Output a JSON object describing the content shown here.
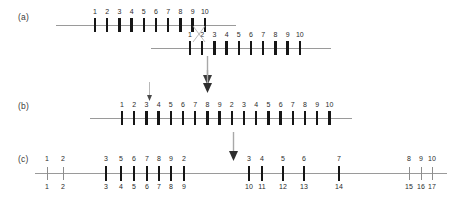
{
  "figure": {
    "panels": [
      {
        "id": "a",
        "label": "(a)",
        "label_x": 18,
        "label_y": 12,
        "description": "Two homologous chromosomes aligned with a crossover point",
        "chromosomes": [
          {
            "name": "chromosome-upper",
            "line_x": 56,
            "line_y": 25,
            "line_width": 180,
            "tick_start": 95,
            "tick_spacing": 12.2,
            "tick_top": 18,
            "tick_height": 14,
            "label_y": 8,
            "labels": [
              "1",
              "2",
              "3",
              "4",
              "5",
              "6",
              "7",
              "8",
              "9",
              "10"
            ]
          },
          {
            "name": "chromosome-lower",
            "line_x": 151,
            "line_y": 48,
            "line_width": 180,
            "tick_start": 190,
            "tick_spacing": 12.2,
            "tick_top": 41,
            "tick_height": 14,
            "label_y": 31,
            "labels": [
              "1",
              "2",
              "3",
              "4",
              "5",
              "6",
              "7",
              "8",
              "9",
              "10"
            ]
          }
        ],
        "crossover": {
          "name": "crossover-x",
          "x": 192,
          "y": 26,
          "width": 14,
          "height": 16
        }
      },
      {
        "id": "b",
        "label": "(b)",
        "label_x": 18,
        "label_y": 101,
        "description": "Recombinant chromosome after crossover",
        "chromosomes": [
          {
            "name": "chromosome-recombinant",
            "line_x": 90,
            "line_y": 118,
            "line_width": 262,
            "tick_start": 122,
            "tick_spacing": 12.2,
            "tick_top": 111,
            "tick_height": 14,
            "label_y": 101,
            "labels": [
              "1",
              "2",
              "3",
              "4",
              "5",
              "6",
              "7",
              "8",
              "9",
              "2",
              "3",
              "4",
              "5",
              "6",
              "7",
              "8",
              "9",
              "10"
            ]
          }
        ]
      },
      {
        "id": "c",
        "label": "(c)",
        "label_x": 18,
        "label_y": 154,
        "description": "Marker map with upper and lower coordinate numbering",
        "axis": {
          "name": "axis-map",
          "line_x": 35,
          "line_y": 173,
          "line_width": 412
        },
        "markers": [
          {
            "x": 47,
            "type": "thin",
            "top": "1",
            "bottom": "1"
          },
          {
            "x": 63,
            "type": "thin",
            "top": "2",
            "bottom": "2"
          },
          {
            "x": 106,
            "type": "thick",
            "top": "3",
            "bottom": "3"
          },
          {
            "x": 121,
            "type": "thick",
            "top": "5",
            "bottom": "4"
          },
          {
            "x": 134,
            "type": "thick",
            "top": "6",
            "bottom": "5"
          },
          {
            "x": 147,
            "type": "thick",
            "top": "7",
            "bottom": "6"
          },
          {
            "x": 159,
            "type": "thick",
            "top": "8",
            "bottom": "7"
          },
          {
            "x": 171,
            "type": "thick",
            "top": "9",
            "bottom": "8"
          },
          {
            "x": 184,
            "type": "thick",
            "top": "2",
            "bottom": "9"
          },
          {
            "x": 249,
            "type": "thick",
            "top": "3",
            "bottom": "10"
          },
          {
            "x": 262,
            "type": "thick",
            "top": "4",
            "bottom": "11"
          },
          {
            "x": 283,
            "type": "thick",
            "top": "5",
            "bottom": "12"
          },
          {
            "x": 304,
            "type": "thick",
            "top": "6",
            "bottom": "13"
          },
          {
            "x": 339,
            "type": "thick",
            "top": "7",
            "bottom": "14"
          },
          {
            "x": 409,
            "type": "thin",
            "top": "8",
            "bottom": "15"
          },
          {
            "x": 421,
            "type": "thin",
            "top": "9",
            "bottom": "16"
          },
          {
            "x": 432,
            "type": "thin",
            "top": "10",
            "bottom": "17"
          }
        ],
        "marker_geometry": {
          "thick_top": 166,
          "thick_height": 15,
          "thin_top": 167,
          "thin_height": 13,
          "label_top_y": 155,
          "label_bottom_y": 183
        }
      }
    ],
    "arrows": [
      {
        "name": "arrow-a-to-b",
        "kind": "large",
        "x": 207,
        "y": 58,
        "length": 28
      },
      {
        "name": "arrow-crossover-site-b",
        "kind": "small",
        "x": 149,
        "y": 84,
        "length": 16
      },
      {
        "name": "arrow-breakpoint-b",
        "kind": "large",
        "x": 207,
        "y": 72,
        "length": 28
      },
      {
        "name": "arrow-b-to-c",
        "kind": "large",
        "x": 233,
        "y": 134,
        "length": 28
      }
    ],
    "colors": {
      "tick_thick": "#161616",
      "tick_thin": "#8d8d8d",
      "axis_line": "#9a9a9a",
      "text": "#2b2b2b",
      "panel_label": "#3a3a3a",
      "arrow": "#7d7d7d",
      "background": "#ffffff"
    }
  }
}
